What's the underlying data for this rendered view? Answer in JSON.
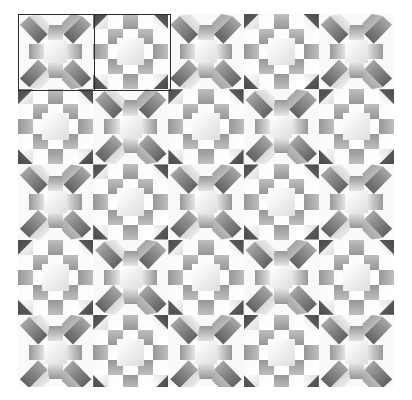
{
  "canvas": {
    "width": 412,
    "height": 400,
    "background": "#ffffff"
  },
  "pattern": {
    "name": "two-block alternating quilt tiling",
    "origin_x": 18,
    "origin_y": 14,
    "width": 376,
    "height": 373,
    "block_size": 75.2,
    "columns": 5,
    "rows": 5,
    "cells_per_block": 5,
    "block_types": [
      "star-cross-block",
      "nine-patch-block"
    ],
    "arrangement": "checkerboard alternation of the two block types",
    "base_background": "#fbfbfb"
  },
  "palette": {
    "darkest": "#4a4a4a",
    "dark": "#6b6b6b",
    "mid": "#969696",
    "light_mid": "#bdbdbd",
    "light": "#dcdcdc",
    "lightest": "#f7f7f7",
    "white": "#ffffff",
    "annotation_stroke": "#2b2b2b"
  },
  "annotations": [
    {
      "id": "annot-block-a",
      "label": "star-cross block outline",
      "x": 18,
      "y": 14,
      "width": 77,
      "height": 77,
      "stroke": "#2b2b2b"
    },
    {
      "id": "annot-block-b",
      "label": "nine-patch block outline",
      "x": 94,
      "y": 14,
      "width": 77,
      "height": 77,
      "stroke": "#2b2b2b"
    }
  ],
  "chart_data": {
    "type": "heatmap",
    "xlabel": "",
    "ylabel": "",
    "grid": false,
    "legend": "none",
    "categories": [
      "col1",
      "col2",
      "col3",
      "col4",
      "col5"
    ],
    "row_labels": [
      "row1",
      "row2",
      "row3",
      "row4",
      "row5"
    ],
    "values": [
      [
        "A",
        "B",
        "A",
        "B",
        "A"
      ],
      [
        "B",
        "A",
        "B",
        "A",
        "B"
      ],
      [
        "A",
        "B",
        "A",
        "B",
        "A"
      ],
      [
        "B",
        "A",
        "B",
        "A",
        "B"
      ],
      [
        "A",
        "B",
        "A",
        "B",
        "A"
      ]
    ],
    "block_legend": {
      "A": "star-cross-block",
      "B": "nine-patch-block"
    },
    "tone_levels": [
      74,
      107,
      150,
      189,
      220,
      247
    ]
  }
}
